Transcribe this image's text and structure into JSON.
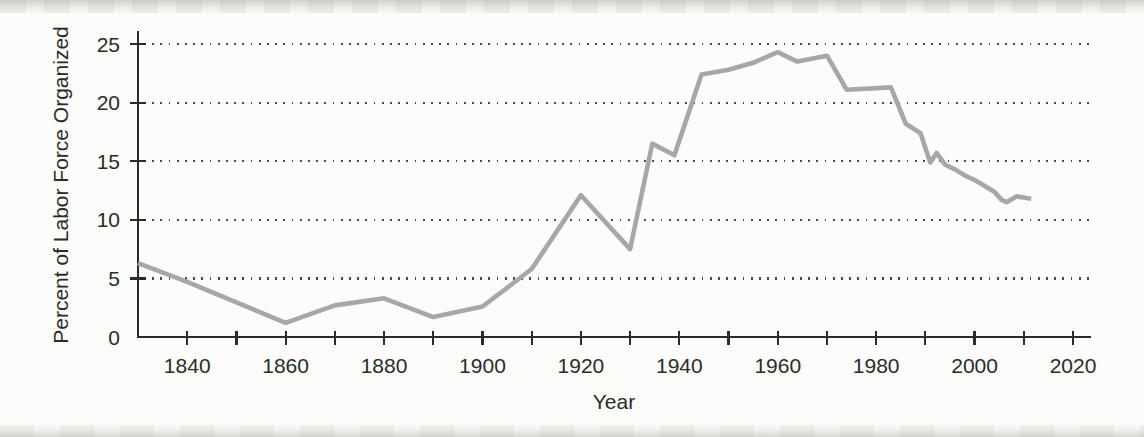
{
  "page": {
    "kind": "scanned-textbook-figure",
    "background_color": "#fcfcfa"
  },
  "chart_data": {
    "type": "line",
    "title": "",
    "xlabel": "Year",
    "ylabel": "Percent of Labor Force Organized",
    "xlim": [
      1830,
      2023
    ],
    "ylim": [
      0,
      26
    ],
    "grid": "dotted horizontal gridlines at labeled y values",
    "legend": "none",
    "x_ticks_all": [
      1840,
      1850,
      1860,
      1870,
      1880,
      1890,
      1900,
      1910,
      1920,
      1930,
      1940,
      1950,
      1960,
      1970,
      1980,
      1990,
      2000,
      2010,
      2020
    ],
    "x_tick_labels": [
      "1840",
      "1860",
      "1880",
      "1900",
      "1920",
      "1940",
      "1960",
      "1980",
      "2000",
      "2020"
    ],
    "x_tick_labeled_years": [
      1840,
      1860,
      1880,
      1900,
      1920,
      1940,
      1960,
      1980,
      2000,
      2020
    ],
    "y_ticks": [
      0,
      5,
      10,
      15,
      20,
      25
    ],
    "y_tick_labels": [
      "0",
      "5",
      "10",
      "15",
      "20",
      "25"
    ],
    "y_gridline_values": [
      5,
      10,
      15,
      20,
      25
    ],
    "colors": {
      "line": "#a7a7a7",
      "axis": "#2b2b2b",
      "grid_dots": "#4b4b4b",
      "text": "#2b2b2b"
    },
    "series": [
      {
        "name": "Percent of labor force organized",
        "points": [
          [
            1830,
            6.3
          ],
          [
            1840,
            4.7
          ],
          [
            1860,
            1.2
          ],
          [
            1870,
            2.7
          ],
          [
            1880,
            3.3
          ],
          [
            1890,
            1.7
          ],
          [
            1900,
            2.6
          ],
          [
            1910,
            5.8
          ],
          [
            1920,
            12.1
          ],
          [
            1930,
            7.5
          ],
          [
            1934.5,
            16.5
          ],
          [
            1939,
            15.5
          ],
          [
            1944.5,
            22.4
          ],
          [
            1950,
            22.8
          ],
          [
            1955,
            23.4
          ],
          [
            1960,
            24.3
          ],
          [
            1964,
            23.5
          ],
          [
            1970,
            24.0
          ],
          [
            1974,
            21.1
          ],
          [
            1983,
            21.3
          ],
          [
            1986,
            18.2
          ],
          [
            1989,
            17.4
          ],
          [
            1990.5,
            15.5
          ],
          [
            1991,
            14.9
          ],
          [
            1992.3,
            15.7
          ],
          [
            1994,
            14.7
          ],
          [
            1996,
            14.3
          ],
          [
            1998,
            13.8
          ],
          [
            2000,
            13.4
          ],
          [
            2002,
            12.9
          ],
          [
            2004,
            12.4
          ],
          [
            2005.5,
            11.7
          ],
          [
            2006.5,
            11.5
          ],
          [
            2008.5,
            12.0
          ],
          [
            2010,
            11.9
          ],
          [
            2011.5,
            11.8
          ]
        ]
      }
    ]
  }
}
